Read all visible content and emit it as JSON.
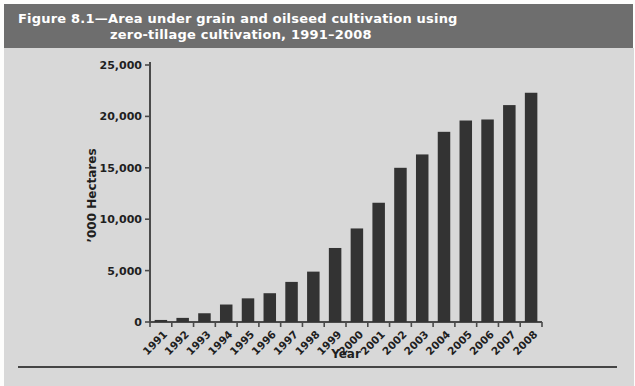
{
  "figure": {
    "title_line1": "Figure 8.1—Area under grain and oilseed cultivation using",
    "title_line2": "zero-tillage cultivation, 1991–2008"
  },
  "colors": {
    "title_bar_bg": "#6e6e6e",
    "title_text": "#ffffff",
    "figure_bg": "#d8d8d8",
    "bar_fill": "#333333",
    "axis": "#4a4a4a",
    "tick_text": "#1f1f1f",
    "bottom_rule": "#454545"
  },
  "chart_data": {
    "type": "bar",
    "title": "Figure 8.1—Area under grain and oilseed cultivation using zero-tillage cultivation, 1991–2008",
    "xlabel": "Year",
    "ylabel": "’000 Hectares",
    "categories": [
      "1991",
      "1992",
      "1993",
      "1994",
      "1995",
      "1996",
      "1997",
      "1998",
      "1999",
      "2000",
      "2001",
      "2002",
      "2003",
      "2004",
      "2005",
      "2006",
      "2007",
      "2008"
    ],
    "values": [
      200,
      400,
      850,
      1700,
      2300,
      2800,
      3900,
      4900,
      7200,
      9100,
      11600,
      15000,
      16300,
      18500,
      19600,
      19700,
      21100,
      22300
    ],
    "ylim": [
      0,
      25000
    ],
    "ytick_step": 5000,
    "ytick_labels": [
      "0",
      "5,000",
      "10,000",
      "15,000",
      "20,000",
      "25,000"
    ],
    "grid": false,
    "legend_position": "none",
    "x_tick_label_rotation_deg": -45
  }
}
